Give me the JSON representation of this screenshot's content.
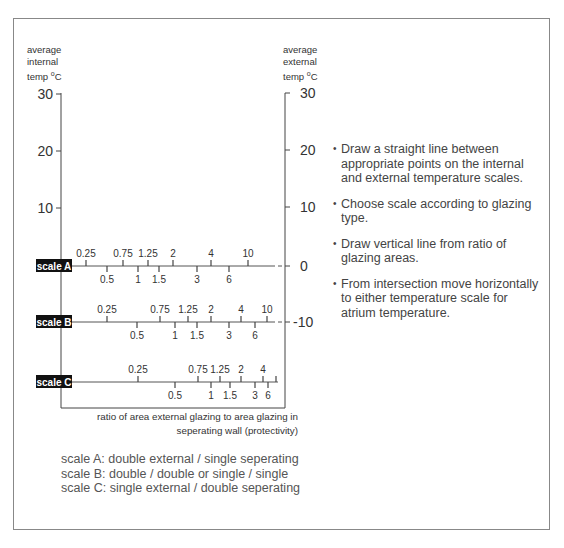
{
  "left_axis": {
    "title_lines": [
      "average",
      "internal",
      "temp"
    ],
    "unit": "oC",
    "ticks": [
      {
        "label": "30",
        "y": 94
      },
      {
        "label": "20",
        "y": 151
      },
      {
        "label": "10",
        "y": 208
      }
    ]
  },
  "right_axis": {
    "title_lines": [
      "average",
      "external",
      "temp"
    ],
    "unit": "oC",
    "ticks": [
      {
        "label": "30",
        "y": 93
      },
      {
        "label": "20",
        "y": 150
      },
      {
        "label": "10",
        "y": 207
      },
      {
        "label": "0",
        "y": 266
      },
      {
        "label": "-10",
        "y": 322
      }
    ]
  },
  "scales": [
    {
      "label": "scale A",
      "y": 266,
      "ticks": [
        {
          "v": "0.25",
          "x": 86,
          "pos": "up"
        },
        {
          "v": "0.5",
          "x": 107,
          "pos": "down"
        },
        {
          "v": "0.75",
          "x": 123,
          "pos": "up"
        },
        {
          "v": "1",
          "x": 138,
          "pos": "down"
        },
        {
          "v": "1.25",
          "x": 148,
          "pos": "up"
        },
        {
          "v": "1.5",
          "x": 159,
          "pos": "down"
        },
        {
          "v": "2",
          "x": 173,
          "pos": "up"
        },
        {
          "v": "3",
          "x": 197,
          "pos": "down"
        },
        {
          "v": "4",
          "x": 211,
          "pos": "up"
        },
        {
          "v": "6",
          "x": 229,
          "pos": "down"
        },
        {
          "v": "10",
          "x": 248,
          "pos": "up"
        }
      ]
    },
    {
      "label": "scale B",
      "y": 322,
      "ticks": [
        {
          "v": "0.25",
          "x": 107,
          "pos": "up"
        },
        {
          "v": "0.5",
          "x": 137,
          "pos": "down"
        },
        {
          "v": "0.75",
          "x": 160,
          "pos": "up"
        },
        {
          "v": "1",
          "x": 175,
          "pos": "down"
        },
        {
          "v": "1.25",
          "x": 188,
          "pos": "up"
        },
        {
          "v": "1.5",
          "x": 197,
          "pos": "down"
        },
        {
          "v": "2",
          "x": 211,
          "pos": "up"
        },
        {
          "v": "3",
          "x": 229,
          "pos": "down"
        },
        {
          "v": "4",
          "x": 241,
          "pos": "up"
        },
        {
          "v": "6",
          "x": 255,
          "pos": "down"
        },
        {
          "v": "10",
          "x": 267,
          "pos": "up"
        }
      ]
    },
    {
      "label": "scale C",
      "y": 382,
      "ticks": [
        {
          "v": "0.25",
          "x": 138,
          "pos": "up"
        },
        {
          "v": "0.5",
          "x": 175,
          "pos": "down"
        },
        {
          "v": "0.75",
          "x": 198,
          "pos": "up"
        },
        {
          "v": "1",
          "x": 211,
          "pos": "down"
        },
        {
          "v": "1.25",
          "x": 220,
          "pos": "up"
        },
        {
          "v": "1.5",
          "x": 230,
          "pos": "down"
        },
        {
          "v": "2",
          "x": 241,
          "pos": "up"
        },
        {
          "v": "3",
          "x": 255,
          "pos": "down"
        },
        {
          "v": "4",
          "x": 263,
          "pos": "up"
        },
        {
          "v": "6",
          "x": 268,
          "pos": "down"
        },
        {
          "v": "",
          "x": 276,
          "pos": "up"
        }
      ]
    }
  ],
  "notes": [
    "Draw a straight line between appropriate points on the internal and external temperature scales.",
    "Choose scale according to glazing type.",
    "Draw vertical line from ratio of glazing areas.",
    "From intersection move horizontally to either temperature scale for atrium temperature."
  ],
  "caption": [
    "ratio of area external glazing to area glazing in",
    "seperating wall  (protectivity)"
  ],
  "legend": [
    "scale A: double external / single seperating",
    "scale B: double / double or single / single",
    "scale C: single external / double seperating"
  ],
  "chart_data": {
    "type": "nomogram",
    "title": "",
    "left_axis": {
      "label": "average internal temp °C",
      "ticks": [
        10,
        20,
        30
      ],
      "range": [
        -10,
        30
      ]
    },
    "right_axis": {
      "label": "average external temp °C",
      "ticks": [
        -10,
        0,
        10,
        20,
        30
      ],
      "range": [
        -10,
        30
      ]
    },
    "xlabel": "ratio of area external glazing to area glazing in seperating wall (protectivity)",
    "series": [
      {
        "name": "scale A",
        "description": "double external / single seperating",
        "ratios": [
          0.25,
          0.5,
          0.75,
          1,
          1.25,
          1.5,
          2,
          3,
          4,
          6,
          10
        ],
        "aligned_temp_level": 0
      },
      {
        "name": "scale B",
        "description": "double / double or single / single",
        "ratios": [
          0.25,
          0.5,
          0.75,
          1,
          1.25,
          1.5,
          2,
          3,
          4,
          6,
          10
        ],
        "aligned_temp_level": -10
      },
      {
        "name": "scale C",
        "description": "single external / double seperating",
        "ratios": [
          0.25,
          0.5,
          0.75,
          1,
          1.25,
          1.5,
          2,
          3,
          4,
          6
        ],
        "aligned_temp_level": null
      }
    ],
    "annotations": [
      "Draw a straight line between appropriate points on the internal and external temperature scales.",
      "Choose scale according to glazing type.",
      "Draw vertical line from ratio of glazing areas.",
      "From intersection move horizontally to either temperature scale for atrium temperature."
    ],
    "grid": false
  }
}
